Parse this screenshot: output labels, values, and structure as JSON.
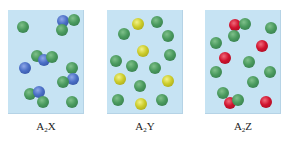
{
  "colors": {
    "panel_background": "#c6e3f3",
    "A": "#4a9a5e",
    "X": "#4b6fc6",
    "Y": "#cccc2a",
    "Z": "#d0132e"
  },
  "panels": [
    {
      "id": "A2X",
      "label_main": "A",
      "label_sub": "2",
      "label_tail": "X",
      "left": 8,
      "atoms": [
        {
          "t": "A",
          "x": 15,
          "y": 17
        },
        {
          "t": "X",
          "x": 55,
          "y": 11
        },
        {
          "t": "A",
          "x": 66,
          "y": 10
        },
        {
          "t": "A",
          "x": 54,
          "y": 20
        },
        {
          "t": "A",
          "x": 29,
          "y": 46
        },
        {
          "t": "X",
          "x": 36,
          "y": 50
        },
        {
          "t": "A",
          "x": 44,
          "y": 47
        },
        {
          "t": "X",
          "x": 17,
          "y": 58
        },
        {
          "t": "A",
          "x": 64,
          "y": 58
        },
        {
          "t": "X",
          "x": 65,
          "y": 69
        },
        {
          "t": "A",
          "x": 55,
          "y": 72
        },
        {
          "t": "A",
          "x": 22,
          "y": 84
        },
        {
          "t": "X",
          "x": 31,
          "y": 82
        },
        {
          "t": "A",
          "x": 35,
          "y": 92
        },
        {
          "t": "A",
          "x": 64,
          "y": 92
        }
      ]
    },
    {
      "id": "A2Y",
      "label_main": "A",
      "label_sub": "2",
      "label_tail": "Y",
      "left": 107,
      "atoms": [
        {
          "t": "Y",
          "x": 31,
          "y": 14
        },
        {
          "t": "A",
          "x": 50,
          "y": 12
        },
        {
          "t": "A",
          "x": 17,
          "y": 24
        },
        {
          "t": "A",
          "x": 61,
          "y": 26
        },
        {
          "t": "Y",
          "x": 36,
          "y": 41
        },
        {
          "t": "A",
          "x": 63,
          "y": 45
        },
        {
          "t": "A",
          "x": 9,
          "y": 51
        },
        {
          "t": "A",
          "x": 25,
          "y": 56
        },
        {
          "t": "A",
          "x": 48,
          "y": 58
        },
        {
          "t": "Y",
          "x": 13,
          "y": 69
        },
        {
          "t": "Y",
          "x": 61,
          "y": 71
        },
        {
          "t": "A",
          "x": 33,
          "y": 76
        },
        {
          "t": "A",
          "x": 11,
          "y": 90
        },
        {
          "t": "Y",
          "x": 34,
          "y": 94
        },
        {
          "t": "A",
          "x": 55,
          "y": 90
        }
      ]
    },
    {
      "id": "A2Z",
      "label_main": "A",
      "label_sub": "2",
      "label_tail": "Z",
      "left": 205,
      "atoms": [
        {
          "t": "Z",
          "x": 30,
          "y": 15
        },
        {
          "t": "A",
          "x": 40,
          "y": 14
        },
        {
          "t": "A",
          "x": 29,
          "y": 26
        },
        {
          "t": "A",
          "x": 66,
          "y": 18
        },
        {
          "t": "A",
          "x": 11,
          "y": 33
        },
        {
          "t": "Z",
          "x": 57,
          "y": 36
        },
        {
          "t": "Z",
          "x": 20,
          "y": 48
        },
        {
          "t": "A",
          "x": 44,
          "y": 52
        },
        {
          "t": "A",
          "x": 11,
          "y": 62
        },
        {
          "t": "A",
          "x": 65,
          "y": 62
        },
        {
          "t": "A",
          "x": 48,
          "y": 72
        },
        {
          "t": "A",
          "x": 18,
          "y": 83
        },
        {
          "t": "Z",
          "x": 25,
          "y": 93
        },
        {
          "t": "A",
          "x": 33,
          "y": 90
        },
        {
          "t": "Z",
          "x": 61,
          "y": 92
        }
      ]
    }
  ]
}
